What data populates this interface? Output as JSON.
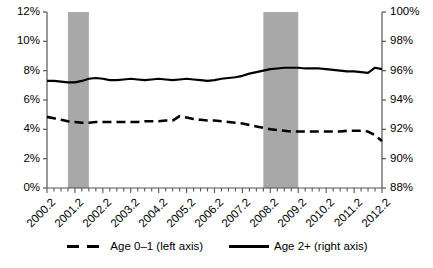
{
  "chart_data": {
    "type": "line",
    "title": "",
    "xlabel": "",
    "ylabel": "",
    "grid": false,
    "legend_position": "bottom-center",
    "x_tick_labels": [
      "2000.2",
      "2001.2",
      "2002.2",
      "2003.2",
      "2004.2",
      "2005.2",
      "2006.2",
      "2007.2",
      "2008.2",
      "2009.2",
      "2010.2",
      "2011.2",
      "2012.2"
    ],
    "x_minor_ticks_per_label": 4,
    "axes": [
      {
        "id": "left",
        "side": "left",
        "ylim": [
          0,
          12
        ],
        "tick_labels": [
          "0%",
          "2%",
          "4%",
          "6%",
          "8%",
          "10%",
          "12%"
        ],
        "tick_values": [
          0,
          2,
          4,
          6,
          8,
          10,
          12
        ]
      },
      {
        "id": "right",
        "side": "right",
        "ylim": [
          88,
          100
        ],
        "tick_labels": [
          "88%",
          "90%",
          "92%",
          "94%",
          "96%",
          "98%",
          "100%"
        ],
        "tick_values": [
          88,
          90,
          92,
          94,
          96,
          98,
          100
        ]
      }
    ],
    "shaded_bands": [
      {
        "name": "recession-2001",
        "x_start": "2001.1",
        "x_end": "2001.4",
        "color": "#a8a8a8"
      },
      {
        "name": "recession-2008",
        "x_start": "2008.1",
        "x_end": "2009.2",
        "color": "#a8a8a8"
      }
    ],
    "series": [
      {
        "name": "Age 0–1 (left axis)",
        "axis": "left",
        "style": "dashed",
        "color": "#000000",
        "x": [
          "2000.2",
          "2000.3",
          "2000.4",
          "2001.1",
          "2001.2",
          "2001.3",
          "2001.4",
          "2002.1",
          "2002.2",
          "2002.3",
          "2002.4",
          "2003.1",
          "2003.2",
          "2003.3",
          "2003.4",
          "2004.1",
          "2004.2",
          "2004.3",
          "2004.4",
          "2005.1",
          "2005.2",
          "2005.3",
          "2005.4",
          "2006.1",
          "2006.2",
          "2006.3",
          "2006.4",
          "2007.1",
          "2007.2",
          "2007.3",
          "2007.4",
          "2008.1",
          "2008.2",
          "2008.3",
          "2008.4",
          "2009.1",
          "2009.2",
          "2009.3",
          "2009.4",
          "2010.1",
          "2010.2",
          "2010.3",
          "2010.4",
          "2011.1",
          "2011.2",
          "2011.3",
          "2011.4",
          "2012.1",
          "2012.2"
        ],
        "values": [
          4.85,
          4.75,
          4.65,
          4.55,
          4.5,
          4.45,
          4.45,
          4.5,
          4.5,
          4.5,
          4.5,
          4.5,
          4.5,
          4.5,
          4.55,
          4.55,
          4.55,
          4.6,
          4.6,
          4.9,
          4.8,
          4.7,
          4.65,
          4.6,
          4.6,
          4.55,
          4.5,
          4.45,
          4.4,
          4.3,
          4.2,
          4.1,
          4.0,
          3.95,
          3.9,
          3.85,
          3.85,
          3.85,
          3.85,
          3.85,
          3.85,
          3.85,
          3.85,
          3.9,
          3.9,
          3.9,
          3.85,
          3.6,
          3.2
        ]
      },
      {
        "name": "Age 2+ (right axis)",
        "axis": "right",
        "style": "solid",
        "color": "#000000",
        "x": [
          "2000.2",
          "2000.3",
          "2000.4",
          "2001.1",
          "2001.2",
          "2001.3",
          "2001.4",
          "2002.1",
          "2002.2",
          "2002.3",
          "2002.4",
          "2003.1",
          "2003.2",
          "2003.3",
          "2003.4",
          "2004.1",
          "2004.2",
          "2004.3",
          "2004.4",
          "2005.1",
          "2005.2",
          "2005.3",
          "2005.4",
          "2006.1",
          "2006.2",
          "2006.3",
          "2006.4",
          "2007.1",
          "2007.2",
          "2007.3",
          "2007.4",
          "2008.1",
          "2008.2",
          "2008.3",
          "2008.4",
          "2009.1",
          "2009.2",
          "2009.3",
          "2009.4",
          "2010.1",
          "2010.2",
          "2010.3",
          "2010.4",
          "2011.1",
          "2011.2",
          "2011.3",
          "2011.4",
          "2012.1",
          "2012.2"
        ],
        "values": [
          95.3,
          95.3,
          95.25,
          95.2,
          95.2,
          95.3,
          95.45,
          95.5,
          95.45,
          95.35,
          95.35,
          95.4,
          95.45,
          95.4,
          95.35,
          95.4,
          95.45,
          95.4,
          95.35,
          95.4,
          95.45,
          95.4,
          95.35,
          95.3,
          95.35,
          95.45,
          95.5,
          95.55,
          95.65,
          95.8,
          95.9,
          96.0,
          96.1,
          96.15,
          96.2,
          96.2,
          96.2,
          96.15,
          96.15,
          96.15,
          96.1,
          96.05,
          96.0,
          95.95,
          95.95,
          95.9,
          95.85,
          96.2,
          96.1
        ]
      }
    ],
    "legend": [
      {
        "label": "Age 0–1 (left axis)",
        "style": "dashed"
      },
      {
        "label": "Age 2+ (right axis)",
        "style": "solid"
      }
    ]
  }
}
